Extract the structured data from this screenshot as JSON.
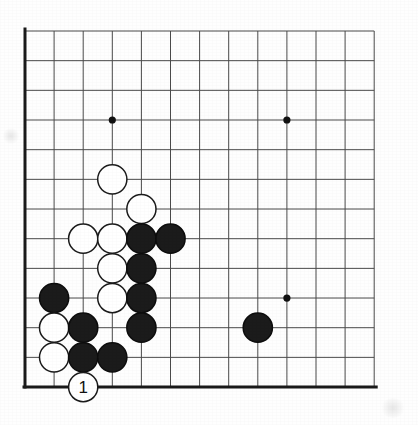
{
  "figure": {
    "kind": "go-board-diagram",
    "title": "Go board corner diagram with move 1",
    "board": {
      "columns": 13,
      "rows": 13,
      "origin_x": 25,
      "origin_y": 31,
      "step_x": 29.1,
      "step_y": 29.67,
      "line_color": "#4a4a4a",
      "edge_color": "#1a1a1a",
      "edge_width": 3.0,
      "line_width": 1.0,
      "background_color": "#fefefe"
    },
    "star_points": {
      "radius": 3.6,
      "color": "#111111",
      "points": [
        {
          "col": 3,
          "row": 3
        },
        {
          "col": 9,
          "row": 3
        },
        {
          "col": 9,
          "row": 9
        }
      ]
    },
    "stone_style": {
      "radius": 14.6,
      "black_fill": "#1b1b1b",
      "black_stroke": "#0d0d0d",
      "white_fill": "#ffffff",
      "white_stroke": "#1a1a1a",
      "stroke_width": 1.5
    },
    "stones": [
      {
        "id": "w-c3r5",
        "color": "white",
        "col": 3,
        "row": 5,
        "label": ""
      },
      {
        "id": "w-c4r6",
        "color": "white",
        "col": 4,
        "row": 6,
        "label": ""
      },
      {
        "id": "w-c2r7",
        "color": "white",
        "col": 2,
        "row": 7,
        "label": ""
      },
      {
        "id": "w-c3r7",
        "color": "white",
        "col": 3,
        "row": 7,
        "label": ""
      },
      {
        "id": "b-c4r7",
        "color": "black",
        "col": 4,
        "row": 7,
        "label": ""
      },
      {
        "id": "b-c5r7",
        "color": "black",
        "col": 5,
        "row": 7,
        "label": ""
      },
      {
        "id": "w-c3r8",
        "color": "white",
        "col": 3,
        "row": 8,
        "label": ""
      },
      {
        "id": "b-c4r8",
        "color": "black",
        "col": 4,
        "row": 8,
        "label": ""
      },
      {
        "id": "b-c1r9",
        "color": "black",
        "col": 1,
        "row": 9,
        "label": ""
      },
      {
        "id": "w-c3r9",
        "color": "white",
        "col": 3,
        "row": 9,
        "label": ""
      },
      {
        "id": "b-c4r9",
        "color": "black",
        "col": 4,
        "row": 9,
        "label": ""
      },
      {
        "id": "w-c1r10",
        "color": "white",
        "col": 1,
        "row": 10,
        "label": ""
      },
      {
        "id": "b-c2r10",
        "color": "black",
        "col": 2,
        "row": 10,
        "label": ""
      },
      {
        "id": "b-c4r10",
        "color": "black",
        "col": 4,
        "row": 10,
        "label": ""
      },
      {
        "id": "b-c8r10",
        "color": "black",
        "col": 8,
        "row": 10,
        "label": ""
      },
      {
        "id": "w-c1r11",
        "color": "white",
        "col": 1,
        "row": 11,
        "label": ""
      },
      {
        "id": "b-c2r11",
        "color": "black",
        "col": 2,
        "row": 11,
        "label": ""
      },
      {
        "id": "b-c3r11",
        "color": "black",
        "col": 3,
        "row": 11,
        "label": ""
      },
      {
        "id": "w-c2r12",
        "color": "white",
        "col": 2,
        "row": 12,
        "label": "1"
      }
    ],
    "move_label": {
      "text": "1",
      "stone_id": "w-c2r12",
      "color": "#111111",
      "font_size": 17
    },
    "counts": {
      "black_stones": 11,
      "white_stones": 8,
      "total_stones": 19
    }
  }
}
